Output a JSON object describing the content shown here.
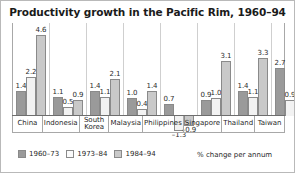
{
  "chart_data": {
    "type": "bar",
    "title": "Productivity growth in the Pacific Rim, 1960–94",
    "xlabel": "",
    "ylabel": "",
    "axis_note": "% change per annum",
    "unit": "% change per annum",
    "grid": false,
    "legend_position": "bottom-left",
    "ylim": [
      -1.6,
      5.0
    ],
    "categories": [
      "China",
      "Indonesia",
      "South Korea",
      "Malaysia",
      "Philippines",
      "Singapore",
      "Thailand",
      "Taiwan"
    ],
    "series": [
      {
        "name": "1960–73",
        "color": "#9a9a9a",
        "values": [
          1.4,
          1.1,
          1.4,
          1.0,
          0.7,
          0.9,
          1.4,
          2.7
        ]
      },
      {
        "name": "1973–84",
        "color": "#f2f2f2",
        "values": [
          2.2,
          0.5,
          1.1,
          0.4,
          -1.3,
          1.0,
          1.1,
          0.9
        ]
      },
      {
        "name": "1984–94",
        "color": "#c9c9c9",
        "values": [
          4.6,
          0.9,
          2.1,
          1.4,
          -0.9,
          3.1,
          3.3,
          2.8
        ]
      }
    ]
  },
  "legend": {
    "items": [
      {
        "label": "1960–73"
      },
      {
        "label": "1973–84"
      },
      {
        "label": "1984–94"
      }
    ]
  }
}
